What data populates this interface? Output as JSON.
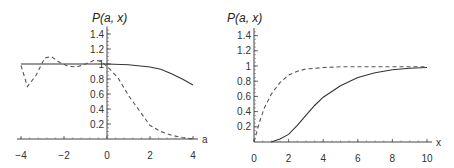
{
  "chart_data": [
    {
      "type": "line",
      "title": "",
      "xlabel": "a",
      "ylabel": "P(a, x)",
      "xlim": [
        -4,
        4
      ],
      "ylim": [
        0,
        1.5
      ],
      "x_ticks": [
        "-4",
        "-2",
        "0",
        "2",
        "4"
      ],
      "y_ticks": [
        "0.2",
        "0.4",
        "0.6",
        "0.8",
        "1",
        "1.2",
        "1.4"
      ],
      "grid": false,
      "series": [
        {
          "name": "solid",
          "style": "solid",
          "x": [
            -4,
            -3,
            -2,
            -1,
            0,
            1,
            2,
            2.5,
            3,
            3.5,
            4
          ],
          "y": [
            1.0,
            1.0,
            1.0,
            1.0,
            1.0,
            0.99,
            0.96,
            0.93,
            0.87,
            0.8,
            0.72
          ]
        },
        {
          "name": "dashed",
          "style": "dashed",
          "x": [
            -4,
            -3.7,
            -3.3,
            -2.9,
            -2.6,
            -2.2,
            -1.8,
            -1.4,
            -1.0,
            -0.6,
            -0.3,
            0,
            0.5,
            1,
            1.5,
            2,
            2.5,
            3,
            3.5,
            4
          ],
          "y": [
            0.98,
            0.7,
            0.85,
            1.08,
            1.1,
            1.02,
            0.97,
            0.96,
            1.0,
            1.05,
            1.04,
            0.97,
            0.82,
            0.58,
            0.38,
            0.18,
            0.1,
            0.05,
            0.02,
            0.0
          ]
        }
      ]
    },
    {
      "type": "line",
      "title": "",
      "xlabel": "x",
      "ylabel": "P(a, x)",
      "xlim": [
        0,
        10
      ],
      "ylim": [
        0,
        1.5
      ],
      "x_ticks": [
        "0",
        "2",
        "4",
        "6",
        "8",
        "10"
      ],
      "y_ticks": [
        "0.2",
        "0.4",
        "0.6",
        "0.8",
        "1",
        "1.2",
        "1.4"
      ],
      "grid": false,
      "series": [
        {
          "name": "solid",
          "style": "solid",
          "x": [
            1,
            1.5,
            2,
            2.5,
            3,
            3.5,
            4,
            5,
            6,
            7,
            8,
            9,
            10
          ],
          "y": [
            0.0,
            0.04,
            0.1,
            0.22,
            0.35,
            0.48,
            0.59,
            0.74,
            0.85,
            0.91,
            0.95,
            0.97,
            0.98
          ]
        },
        {
          "name": "dashed",
          "style": "dashed",
          "x": [
            0,
            0.3,
            0.6,
            1,
            1.5,
            2,
            2.5,
            3,
            3.5,
            4,
            5,
            6,
            8,
            10
          ],
          "y": [
            0.0,
            0.25,
            0.45,
            0.63,
            0.78,
            0.88,
            0.93,
            0.96,
            0.97,
            0.98,
            0.99,
            0.99,
            0.99,
            0.99
          ]
        }
      ]
    }
  ]
}
